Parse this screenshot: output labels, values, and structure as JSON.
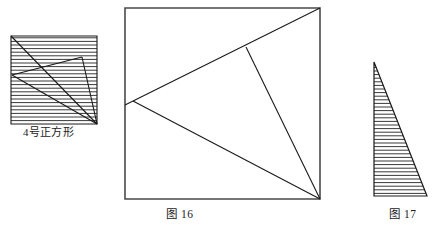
{
  "page": {
    "background_color": "#ffffff",
    "stroke_color": "#1a1a1a",
    "hatch_color": "#3a3a3a",
    "width": 447,
    "height": 232
  },
  "captions": {
    "left_figure": "4号正方形",
    "middle_figure": "图 16",
    "right_figure": "图 17"
  },
  "figures": {
    "left_square": {
      "name": "4号正方形",
      "shape": "square",
      "hatched": true,
      "hatch_direction": "horizontal",
      "hatch_spacing": 3.6,
      "outline": [
        [
          11,
          36
        ],
        [
          97,
          36
        ],
        [
          97,
          124
        ],
        [
          11,
          124
        ]
      ],
      "inner_lines": [
        [
          [
            11,
            36
          ],
          [
            97,
            124
          ]
        ],
        [
          [
            12,
            75
          ],
          [
            82,
            57
          ]
        ],
        [
          [
            12,
            75
          ],
          [
            97,
            124
          ]
        ],
        [
          [
            82,
            57
          ],
          [
            97,
            124
          ]
        ]
      ]
    },
    "middle_square": {
      "name": "图 16",
      "shape": "square",
      "hatched": false,
      "outline": [
        [
          125,
          8
        ],
        [
          320,
          8
        ],
        [
          320,
          199
        ],
        [
          125,
          199
        ]
      ],
      "inner_lines": [
        [
          [
            125,
            105
          ],
          [
            320,
            8
          ]
        ],
        [
          [
            133,
            101
          ],
          [
            320,
            199
          ]
        ],
        [
          [
            246,
            47
          ],
          [
            320,
            199
          ]
        ]
      ]
    },
    "right_triangle": {
      "name": "图 17",
      "shape": "right-triangle",
      "hatched": true,
      "hatch_direction": "horizontal",
      "hatch_spacing": 3.6,
      "outline": [
        [
          374,
          62
        ],
        [
          427,
          196
        ],
        [
          374,
          196
        ]
      ]
    }
  }
}
